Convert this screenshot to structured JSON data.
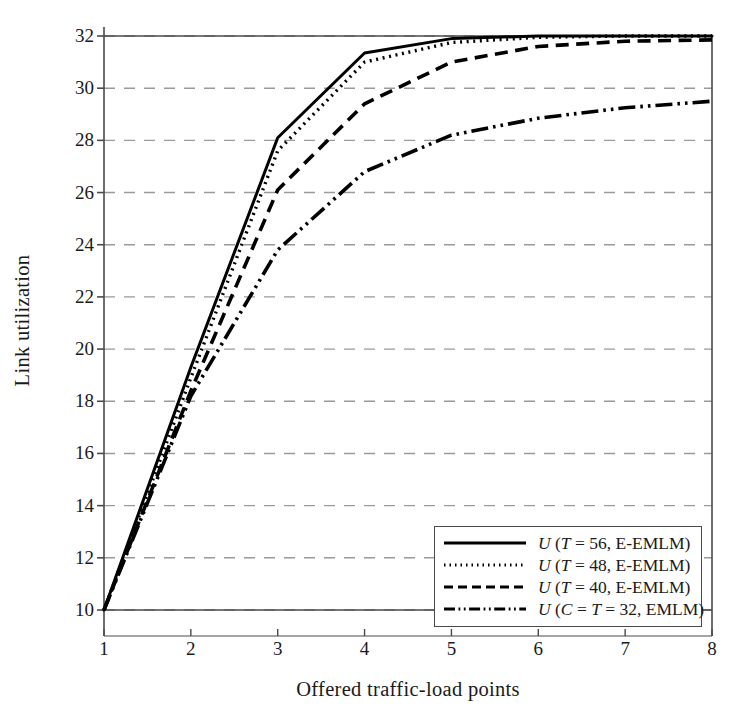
{
  "chart_data": {
    "type": "line",
    "title": "",
    "xlabel": "Offered traffic-load points",
    "ylabel": "Link utilization",
    "x": [
      1,
      2,
      3,
      4,
      5,
      6,
      7,
      8
    ],
    "xlim": [
      1,
      8
    ],
    "ylim": [
      9.2,
      32.6
    ],
    "xticks": [
      "1",
      "2",
      "3",
      "4",
      "5",
      "6",
      "7",
      "8"
    ],
    "yticks": [
      "10",
      "12",
      "14",
      "16",
      "18",
      "20",
      "22",
      "24",
      "26",
      "28",
      "30",
      "32"
    ],
    "grid": "horizontal-dashed",
    "legend_position": "lower-right",
    "series": [
      {
        "name": "U (T = 56, E-EMLM)",
        "style": "solid",
        "values": [
          10,
          19.3,
          28.1,
          31.35,
          31.9,
          32.0,
          32.0,
          32.0
        ]
      },
      {
        "name": "U (T = 48, E-EMLM)",
        "style": "dotted",
        "values": [
          10,
          18.9,
          27.6,
          31.0,
          31.75,
          31.95,
          32.0,
          32.0
        ]
      },
      {
        "name": "U (T = 40, E-EMLM)",
        "style": "dashed",
        "values": [
          10,
          18.4,
          26.1,
          29.4,
          31.0,
          31.6,
          31.8,
          31.85
        ]
      },
      {
        "name": "U (C = T = 32, EMLM)",
        "style": "dash-dot-dot",
        "values": [
          10,
          18.2,
          23.8,
          26.8,
          28.2,
          28.85,
          29.25,
          29.5
        ]
      }
    ],
    "colors": {
      "line": "#000000",
      "axis": "#4a4a4a",
      "grid": "#9a9a9a",
      "background": "#ffffff"
    }
  },
  "legend": {
    "entries": [
      {
        "label_prefix": "U",
        "label_body": " (T = 56, E-EMLM)",
        "full": "U (T = 56, E-EMLM)"
      },
      {
        "label_prefix": "U",
        "label_body": " (T = 48, E-EMLM)",
        "full": "U (T = 48, E-EMLM)"
      },
      {
        "label_prefix": "U",
        "label_body": " (T = 40, E-EMLM)",
        "full": "U (T = 40, E-EMLM)"
      },
      {
        "label_prefix": "U",
        "label_body": " (C = T = 32, EMLM)",
        "full": "U (C = T = 32, EMLM)"
      }
    ]
  },
  "axes": {
    "y_label": "Link utilization",
    "x_label": "Offered traffic-load points",
    "y_tick_labels": [
      "32",
      "30",
      "28",
      "26",
      "24",
      "22",
      "20",
      "18",
      "16",
      "14",
      "12",
      "10"
    ],
    "x_tick_labels": [
      "1",
      "2",
      "3",
      "4",
      "5",
      "6",
      "7",
      "8"
    ]
  }
}
